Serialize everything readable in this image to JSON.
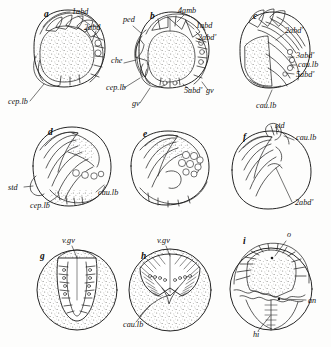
{
  "figure": {
    "kind": "scientific-illustration-plate",
    "medium": "pen-and-ink line drawing with stipple shading",
    "background_color": "#fdfdfc",
    "ink_color": "#1a1a1a",
    "stipple_color": "#8a8a86",
    "panel_count": 9,
    "rows": 3,
    "columns": 3,
    "caption": "",
    "caption_note": "caption text is cropped off at the bottom edge of the screenshot and is not legible"
  },
  "panels": [
    {
      "id": "a",
      "letter": "a",
      "row": 1,
      "column": 1,
      "shaded": true,
      "description": "rounded test in lateral view, stippled body with segmented brachial appendages arching over the upper margin and a plated marginal series at right",
      "labels": [
        {
          "text": "1abd",
          "x": 72,
          "y": 14
        },
        {
          "text": "2abd",
          "x": 84,
          "y": 30
        },
        {
          "text": "cep.lb",
          "x": 8,
          "y": 104
        }
      ]
    },
    {
      "id": "b",
      "letter": "b",
      "row": 1,
      "column": 2,
      "shaded": true,
      "description": "rounded test in oblique view with pedunculate stalk at upper left, ambulacral plate series across the crown and a ringed marginal plate series at right",
      "labels": [
        {
          "text": "4amb",
          "x": 178,
          "y": 13
        },
        {
          "text": "ped",
          "x": 123,
          "y": 22
        },
        {
          "text": "1abd",
          "x": 196,
          "y": 28
        },
        {
          "text": "2abd'",
          "x": 198,
          "y": 40
        },
        {
          "text": "che",
          "x": 111,
          "y": 63
        },
        {
          "text": "cep.lb",
          "x": 106,
          "y": 90
        },
        {
          "text": "gv",
          "x": 132,
          "y": 106
        },
        {
          "text": "5abd'",
          "x": 184,
          "y": 93
        },
        {
          "text": "gv",
          "x": 206,
          "y": 93
        }
      ]
    },
    {
      "id": "c",
      "letter": "c",
      "row": 1,
      "column": 3,
      "shaded": true,
      "description": "rounded test turned to show the caudal lobe, with long curved appendage rays radiating from a stippled wedge and small ossicle rings at the right margin",
      "labels": [
        {
          "text": "2abd'",
          "x": 285,
          "y": 33
        },
        {
          "text": "3abd'",
          "x": 296,
          "y": 58
        },
        {
          "text": "cau.lb",
          "x": 298,
          "y": 67
        },
        {
          "text": "5abd'",
          "x": 296,
          "y": 77
        },
        {
          "text": "cau.lb",
          "x": 256,
          "y": 108
        }
      ]
    },
    {
      "id": "d",
      "letter": "d",
      "row": 2,
      "column": 1,
      "shaded": true,
      "description": "globular specimen with folded appendages sweeping left, stippled patches on the upper right quadrant and a row of round ossicles below them",
      "labels": [
        {
          "text": "std",
          "x": 8,
          "y": 190
        },
        {
          "text": "cep.lb",
          "x": 30,
          "y": 208
        },
        {
          "text": "cau.lb",
          "x": 98,
          "y": 195
        }
      ]
    },
    {
      "id": "e",
      "letter": "e",
      "row": 2,
      "column": 2,
      "shaded": false,
      "description": "unlabelled broad oval specimen with stippled dorsal band and a grape-like cluster of rounded ossicles at the right side",
      "labels": []
    },
    {
      "id": "f",
      "letter": "f",
      "row": 2,
      "column": 3,
      "shaded": false,
      "description": "plain outline drawing without stipple, showing the appendage bundle at left and the bare rounded test at right",
      "labels": [
        {
          "text": "std",
          "x": 275,
          "y": 128
        },
        {
          "text": "cau.lb",
          "x": 296,
          "y": 140
        },
        {
          "text": "2abd'",
          "x": 295,
          "y": 205
        }
      ]
    },
    {
      "id": "g",
      "letter": "g",
      "row": 3,
      "column": 1,
      "shaded": true,
      "description": "ventral view, circular stippled test with a deep U-shaped ventral groove flanked by ladder-like transverse bars and two columns of small pores",
      "labels": [
        {
          "text": "v.gv",
          "x": 62,
          "y": 243
        }
      ]
    },
    {
      "id": "h",
      "letter": "h",
      "row": 3,
      "column": 2,
      "shaded": true,
      "description": "ventral view, circular stippled test with a V-shaped ventral groove and two comb-like fields of fine striations bearing rows of small pores",
      "labels": [
        {
          "text": "v.gv",
          "x": 157,
          "y": 243
        },
        {
          "text": "cau.lb",
          "x": 123,
          "y": 327
        }
      ]
    },
    {
      "id": "i",
      "letter": "i",
      "row": 3,
      "column": 3,
      "shaded": true,
      "description": "oral view, circular test with radiating plate series around a stippled oral field, a zig-zag suture across the middle and a vertical hinge line below",
      "labels": [
        {
          "text": "o",
          "x": 287,
          "y": 237
        },
        {
          "text": "an",
          "x": 308,
          "y": 303
        },
        {
          "text": "hi",
          "x": 253,
          "y": 337
        }
      ]
    }
  ],
  "label_glossary": [
    {
      "abbr": "1abd",
      "meaning": "first abdominal segment"
    },
    {
      "abbr": "2abd",
      "meaning": "second abdominal segment"
    },
    {
      "abbr": "2abd'",
      "meaning": "second abdominal segment (counterpart)"
    },
    {
      "abbr": "3abd'",
      "meaning": "third abdominal segment (counterpart)"
    },
    {
      "abbr": "5abd'",
      "meaning": "fifth abdominal segment (counterpart)"
    },
    {
      "abbr": "4amb",
      "meaning": "fourth ambulacral plate"
    },
    {
      "abbr": "cep.lb",
      "meaning": "cephalic lobe"
    },
    {
      "abbr": "cau.lb",
      "meaning": "caudal lobe"
    },
    {
      "abbr": "ped",
      "meaning": "peduncle"
    },
    {
      "abbr": "che",
      "meaning": "chela"
    },
    {
      "abbr": "gv",
      "meaning": "groove"
    },
    {
      "abbr": "v.gv",
      "meaning": "ventral groove"
    },
    {
      "abbr": "std",
      "meaning": "stem / stalk disc"
    },
    {
      "abbr": "o",
      "meaning": "oral opening"
    },
    {
      "abbr": "an",
      "meaning": "anus"
    },
    {
      "abbr": "hi",
      "meaning": "hinge"
    }
  ]
}
